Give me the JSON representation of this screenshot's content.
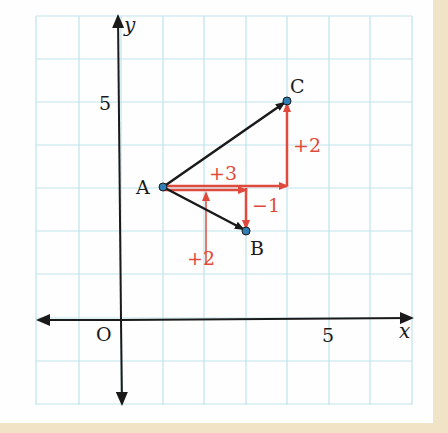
{
  "figure": {
    "type": "coordinate-plane-vector-diagram",
    "axes": {
      "x_label": "x",
      "y_label": "y",
      "origin_label": "O",
      "x_tick_label": "5",
      "y_tick_label": "5"
    },
    "points": [
      {
        "name": "A",
        "x": 1,
        "y": 3
      },
      {
        "name": "B",
        "x": 3,
        "y": 2
      },
      {
        "name": "C",
        "x": 4,
        "y": 5
      }
    ],
    "vectors": [
      {
        "from": "A",
        "to": "B",
        "color": "#1a1a1a"
      },
      {
        "from": "A",
        "to": "C",
        "color": "#1a1a1a"
      }
    ],
    "components": {
      "ac_horizontal": "+3",
      "ac_vertical": "+2",
      "ab_horizontal": "+2",
      "ab_vertical": "−1"
    },
    "colors": {
      "grid": "#bfe3ea",
      "axis": "#1a1a1a",
      "component": "#e04a3c",
      "point": "#2f7fb5",
      "paper": "#fefefe",
      "border": "#f1e3c6"
    }
  }
}
